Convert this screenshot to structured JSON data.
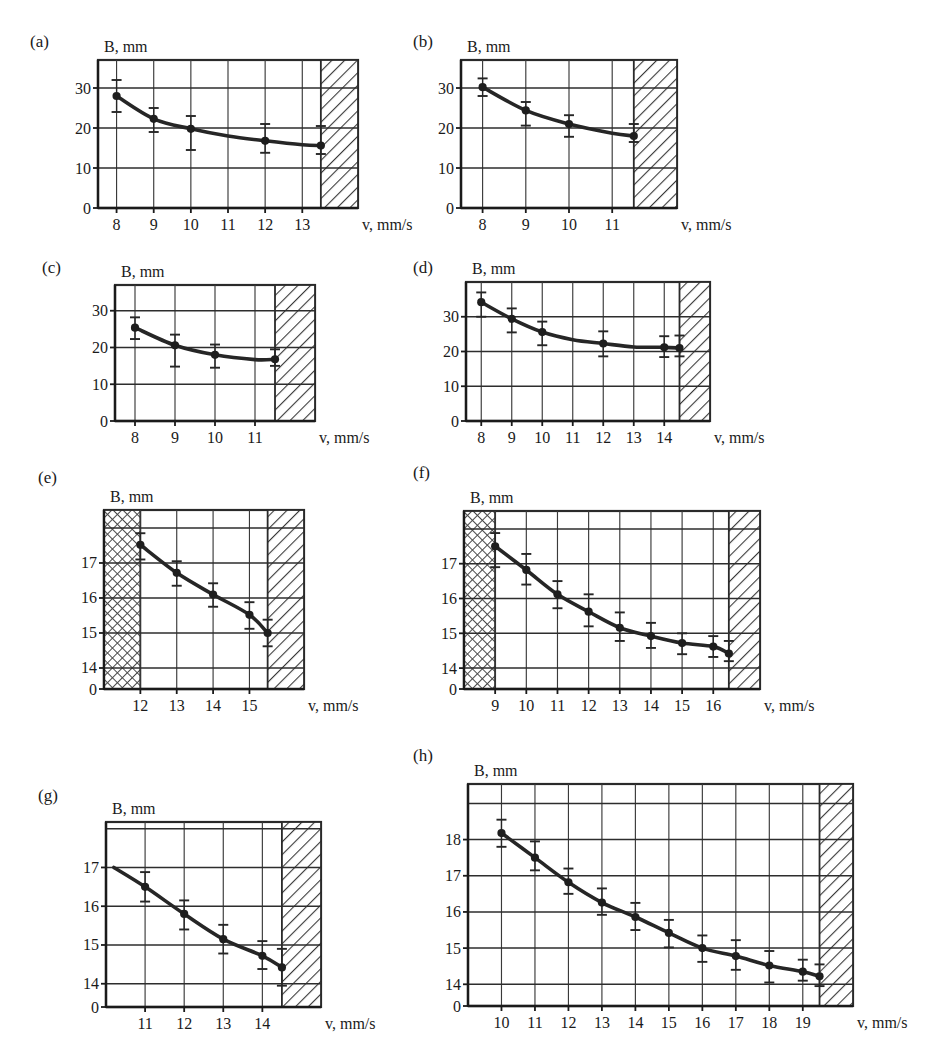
{
  "figure": {
    "axis_y_title": "B, mm",
    "axis_x_title": "v, mm/s",
    "panel_labels": [
      "(a)",
      "(b)",
      "(c)",
      "(d)",
      "(e)",
      "(f)",
      "(g)",
      "(h)"
    ]
  },
  "chart_data": [
    {
      "id": "a",
      "panel_label": "(a)",
      "type": "line",
      "title": "",
      "xlabel": "v, mm/s",
      "ylabel": "B, mm",
      "xticks": [
        8,
        9,
        10,
        11,
        12,
        13
      ],
      "yticks": [
        0,
        10,
        20,
        30
      ],
      "xlim": [
        7.5,
        14.5
      ],
      "ylim": [
        0,
        37
      ],
      "grid": true,
      "hatch_right_from": 13.5,
      "hatch_left_to": null,
      "x": [
        8,
        9,
        10,
        11,
        12,
        13,
        13.5
      ],
      "values": [
        28.0,
        22.3,
        19.8,
        18.0,
        16.8,
        15.8,
        15.6
      ],
      "yerr_low": [
        24.0,
        19.0,
        14.5,
        null,
        13.8,
        null,
        13.5
      ],
      "yerr_high": [
        32.0,
        25.0,
        23.0,
        null,
        21.0,
        null,
        20.5
      ],
      "markers_at": [
        8,
        9,
        10,
        12,
        13.5
      ]
    },
    {
      "id": "b",
      "panel_label": "(b)",
      "type": "line",
      "title": "",
      "xlabel": "v, mm/s",
      "ylabel": "B, mm",
      "xticks": [
        8,
        9,
        10,
        11
      ],
      "yticks": [
        0,
        10,
        20,
        30
      ],
      "xlim": [
        7.5,
        12.5
      ],
      "ylim": [
        0,
        37
      ],
      "grid": true,
      "hatch_right_from": 11.5,
      "hatch_left_to": null,
      "x": [
        8,
        9,
        10,
        11,
        11.5
      ],
      "values": [
        30.2,
        24.4,
        21.0,
        18.7,
        18.0
      ],
      "yerr_low": [
        28.0,
        20.6,
        17.8,
        null,
        16.5
      ],
      "yerr_high": [
        32.4,
        26.5,
        23.2,
        null,
        21.0
      ],
      "markers_at": [
        8,
        9,
        10,
        11.5
      ]
    },
    {
      "id": "c",
      "panel_label": "(c)",
      "type": "line",
      "title": "",
      "xlabel": "v, mm/s",
      "ylabel": "B, mm",
      "xticks": [
        8,
        9,
        10,
        11
      ],
      "yticks": [
        0,
        10,
        20,
        30
      ],
      "xlim": [
        7.5,
        12.5
      ],
      "ylim": [
        0,
        37
      ],
      "grid": true,
      "hatch_right_from": 11.5,
      "hatch_left_to": null,
      "x": [
        8,
        9,
        10,
        11,
        11.5
      ],
      "values": [
        25.4,
        20.6,
        18.0,
        16.7,
        16.8
      ],
      "yerr_low": [
        22.3,
        14.8,
        14.5,
        null,
        15.0
      ],
      "yerr_high": [
        28.2,
        23.5,
        20.8,
        null,
        19.5
      ],
      "markers_at": [
        8,
        9,
        10,
        11.5
      ]
    },
    {
      "id": "d",
      "panel_label": "(d)",
      "type": "line",
      "title": "",
      "xlabel": "v, mm/s",
      "ylabel": "B, mm",
      "xticks": [
        8,
        9,
        10,
        11,
        12,
        13,
        14
      ],
      "yticks": [
        0,
        10,
        20,
        30
      ],
      "xlim": [
        7.5,
        15.5
      ],
      "ylim": [
        0,
        40
      ],
      "grid": true,
      "hatch_right_from": 14.5,
      "hatch_left_to": null,
      "x": [
        8,
        9,
        10,
        11,
        12,
        13,
        14,
        14.5
      ],
      "values": [
        34.2,
        29.4,
        25.6,
        23.4,
        22.3,
        21.3,
        21.2,
        21.0
      ],
      "yerr_low": [
        30.0,
        25.5,
        21.8,
        null,
        18.6,
        null,
        18.4,
        18.6
      ],
      "yerr_high": [
        37.0,
        32.4,
        28.6,
        null,
        25.8,
        null,
        24.4,
        24.6
      ],
      "markers_at": [
        8,
        9,
        10,
        12,
        14,
        14.5
      ]
    },
    {
      "id": "e",
      "panel_label": "(e)",
      "type": "line",
      "title": "",
      "xlabel": "v, mm/s",
      "ylabel": "B, mm",
      "xticks": [
        12,
        13,
        14,
        15
      ],
      "yticks": [
        0,
        14,
        15,
        16,
        17
      ],
      "ybreak": true,
      "xlim": [
        11,
        16.5
      ],
      "ylim": [
        13.4,
        17.9
      ],
      "grid": true,
      "hatch_right_from": 15.5,
      "hatch_left_to": 12,
      "x": [
        12,
        13,
        14,
        15,
        15.5
      ],
      "values": [
        17.52,
        16.72,
        16.1,
        15.52,
        15.0
      ],
      "yerr_low": [
        17.1,
        16.35,
        15.75,
        15.12,
        14.62
      ],
      "yerr_high": [
        17.85,
        17.05,
        16.42,
        15.88,
        15.38
      ],
      "markers_at": [
        12,
        13,
        14,
        15,
        15.5
      ]
    },
    {
      "id": "f",
      "panel_label": "(f)",
      "type": "line",
      "title": "",
      "xlabel": "v, mm/s",
      "ylabel": "B, mm",
      "xticks": [
        9,
        10,
        11,
        12,
        13,
        14,
        15,
        16
      ],
      "yticks": [
        0,
        14,
        15,
        16,
        17
      ],
      "ybreak": true,
      "xlim": [
        8,
        17.5
      ],
      "ylim": [
        13.4,
        17.9
      ],
      "grid": true,
      "hatch_right_from": 16.5,
      "hatch_left_to": 9,
      "x": [
        9,
        10,
        11,
        12,
        13,
        14,
        15,
        16,
        16.5
      ],
      "values": [
        17.5,
        16.82,
        16.12,
        15.62,
        15.16,
        14.92,
        14.72,
        14.62,
        14.42
      ],
      "yerr_low": [
        16.9,
        16.4,
        15.72,
        15.2,
        14.78,
        14.58,
        14.4,
        14.32,
        14.2
      ],
      "yerr_high": [
        17.88,
        17.28,
        16.5,
        16.12,
        15.6,
        15.3,
        15.0,
        14.92,
        14.78
      ],
      "markers_at": [
        9,
        10,
        11,
        12,
        13,
        14,
        15,
        16,
        16.5
      ]
    },
    {
      "id": "g",
      "panel_label": "(g)",
      "type": "line",
      "title": "",
      "xlabel": "v, mm/s",
      "ylabel": "B, mm",
      "xticks": [
        11,
        12,
        13,
        14
      ],
      "yticks": [
        0,
        14,
        15,
        16,
        17
      ],
      "ybreak": true,
      "xlim": [
        10,
        15.5
      ],
      "ylim": [
        13.4,
        17.6
      ],
      "grid": true,
      "hatch_right_from": 14.5,
      "hatch_left_to": null,
      "x": [
        10.2,
        11,
        12,
        13,
        14,
        14.5
      ],
      "values": [
        17.0,
        16.5,
        15.8,
        15.15,
        14.72,
        14.42
      ],
      "yerr_low": [
        null,
        16.12,
        15.4,
        14.78,
        14.38,
        13.95
      ],
      "yerr_high": [
        null,
        16.88,
        16.15,
        15.52,
        15.1,
        14.9
      ],
      "markers_at": [
        11,
        12,
        13,
        14,
        14.5
      ]
    },
    {
      "id": "h",
      "panel_label": "(h)",
      "type": "line",
      "title": "",
      "xlabel": "v, mm/s",
      "ylabel": "B, mm",
      "xticks": [
        10,
        11,
        12,
        13,
        14,
        15,
        16,
        17,
        18,
        19
      ],
      "yticks": [
        0,
        14,
        15,
        16,
        17,
        18
      ],
      "ybreak": true,
      "xlim": [
        9,
        20.5
      ],
      "ylim": [
        13.4,
        18.8
      ],
      "grid": true,
      "hatch_right_from": 19.5,
      "hatch_left_to": null,
      "x": [
        10,
        11,
        12,
        13,
        14,
        15,
        16,
        17,
        18,
        19,
        19.5
      ],
      "values": [
        18.18,
        17.5,
        16.82,
        16.26,
        15.86,
        15.42,
        15.0,
        14.78,
        14.52,
        14.35,
        14.22
      ],
      "yerr_low": [
        17.8,
        17.15,
        16.5,
        15.92,
        15.5,
        15.02,
        14.62,
        14.4,
        14.05,
        14.1,
        13.95
      ],
      "yerr_high": [
        18.55,
        17.95,
        17.2,
        16.65,
        16.25,
        15.78,
        15.35,
        15.22,
        14.92,
        14.68,
        14.55
      ],
      "markers_at": [
        10,
        11,
        12,
        13,
        14,
        15,
        16,
        17,
        18,
        19,
        19.5
      ]
    }
  ],
  "layout": [
    {
      "id": "a",
      "label_x": 30,
      "label_y": 32,
      "plot_x": 98,
      "plot_y": 60,
      "plot_w": 260,
      "plot_h": 148
    },
    {
      "id": "b",
      "label_x": 413,
      "label_y": 32,
      "plot_x": 461,
      "plot_y": 60,
      "plot_w": 216,
      "plot_h": 148
    },
    {
      "id": "c",
      "label_x": 42,
      "label_y": 258,
      "plot_x": 115,
      "plot_y": 285,
      "plot_w": 200,
      "plot_h": 136
    },
    {
      "id": "d",
      "label_x": 413,
      "label_y": 258,
      "plot_x": 466,
      "plot_y": 282,
      "plot_w": 244,
      "plot_h": 139
    },
    {
      "id": "e",
      "label_x": 38,
      "label_y": 468,
      "plot_x": 104,
      "plot_y": 510,
      "plot_w": 200,
      "plot_h": 179
    },
    {
      "id": "f",
      "label_x": 413,
      "label_y": 463,
      "plot_x": 464,
      "plot_y": 511,
      "plot_w": 296,
      "plot_h": 178
    },
    {
      "id": "g",
      "label_x": 38,
      "label_y": 786,
      "plot_x": 106,
      "plot_y": 822,
      "plot_w": 215,
      "plot_h": 185
    },
    {
      "id": "h",
      "label_x": 413,
      "label_y": 746,
      "plot_x": 468,
      "plot_y": 784,
      "plot_w": 385,
      "plot_h": 222
    }
  ]
}
